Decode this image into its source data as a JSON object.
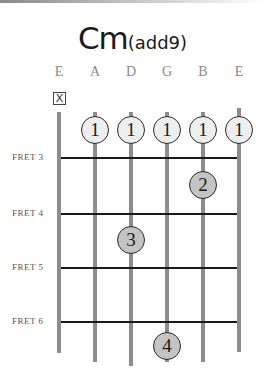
{
  "chord": {
    "name": "Cm",
    "suffix": "(add9)"
  },
  "strings": [
    {
      "label": "E",
      "x": 59
    },
    {
      "label": "A",
      "x": 95
    },
    {
      "label": "D",
      "x": 131
    },
    {
      "label": "G",
      "x": 167
    },
    {
      "label": "B",
      "x": 203
    },
    {
      "label": "E",
      "x": 239
    }
  ],
  "muted_marker": "X",
  "frets": [
    {
      "label": "FRET 3",
      "y": 158
    },
    {
      "label": "FRET 4",
      "y": 214
    },
    {
      "label": "FRET 5",
      "y": 268
    },
    {
      "label": "FRET 6",
      "y": 322
    }
  ],
  "fingers": [
    {
      "finger": "1",
      "string": 1,
      "x": 95,
      "y": 130,
      "type": "open"
    },
    {
      "finger": "1",
      "string": 2,
      "x": 131,
      "y": 130,
      "type": "open"
    },
    {
      "finger": "1",
      "string": 3,
      "x": 167,
      "y": 130,
      "type": "open"
    },
    {
      "finger": "1",
      "string": 4,
      "x": 203,
      "y": 130,
      "type": "open"
    },
    {
      "finger": "1",
      "string": 5,
      "x": 239,
      "y": 130,
      "type": "open"
    },
    {
      "finger": "2",
      "string": 4,
      "x": 203,
      "y": 185,
      "type": "fretted"
    },
    {
      "finger": "3",
      "string": 2,
      "x": 131,
      "y": 240,
      "type": "fretted"
    },
    {
      "finger": "4",
      "string": 3,
      "x": 167,
      "y": 346,
      "type": "fretted"
    }
  ]
}
